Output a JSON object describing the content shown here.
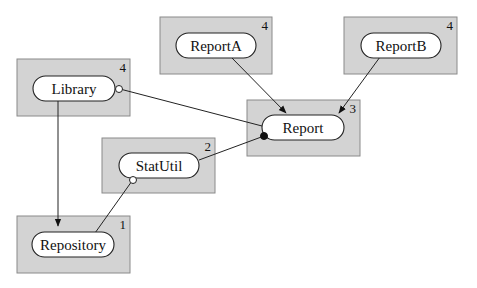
{
  "diagram": {
    "type": "package-dependency-diagram",
    "nodes": [
      {
        "id": "library",
        "label": "Library",
        "level": "4"
      },
      {
        "id": "reporta",
        "label": "ReportA",
        "level": "4"
      },
      {
        "id": "reportb",
        "label": "ReportB",
        "level": "4"
      },
      {
        "id": "report",
        "label": "Report",
        "level": "3"
      },
      {
        "id": "statutil",
        "label": "StatUtil",
        "level": "2"
      },
      {
        "id": "repository",
        "label": "Repository",
        "level": "1"
      }
    ],
    "edges": [
      {
        "from": "ReportA",
        "to": "Report",
        "style": "arrow"
      },
      {
        "from": "ReportB",
        "to": "Report",
        "style": "arrow"
      },
      {
        "from": "Library",
        "to": "Report",
        "style": "open-circle at Library"
      },
      {
        "from": "StatUtil",
        "to": "Report",
        "style": "filled-circle at Report"
      },
      {
        "from": "Library",
        "to": "Repository",
        "style": "arrow"
      },
      {
        "from": "Repository",
        "to": "StatUtil",
        "style": "open-circle at StatUtil"
      }
    ]
  }
}
